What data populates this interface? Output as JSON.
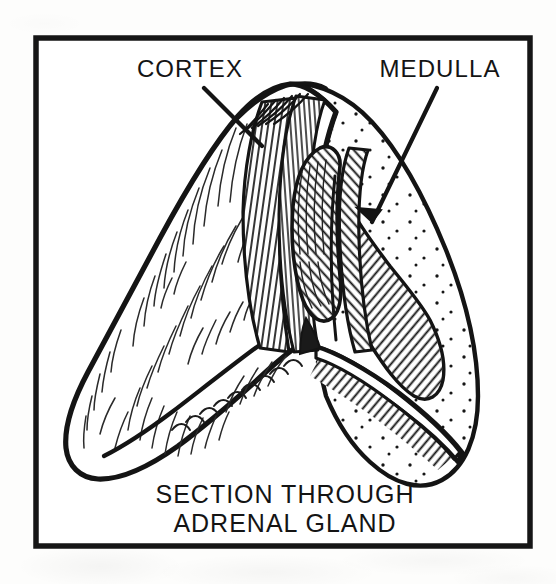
{
  "figure": {
    "kind": "anatomical-line-illustration",
    "frame": {
      "border_color": "#161616",
      "fill_color": "#ffffff",
      "border_width_px": 5
    },
    "ink_color": "#111111",
    "paper_color": "#fdfdfc",
    "annotations": [
      {
        "id": "cortex",
        "label": "CORTEX",
        "label_x": 190,
        "label_y": 77,
        "anchor": "middle",
        "leader": {
          "x1": 204,
          "y1": 88,
          "x2": 262,
          "y2": 146
        },
        "region_texture": "dense-vertical-hatching",
        "description": "outer layer of the gland, shown with close parallel hatch lines"
      },
      {
        "id": "medulla",
        "label": "MEDULLA",
        "label_x": 440,
        "label_y": 77,
        "anchor": "middle",
        "leader": {
          "x1": 437,
          "y1": 88,
          "x2": 370,
          "y2": 223
        },
        "arrowhead": true,
        "region_texture": "stipple-dots",
        "description": "inner core of the gland, shown with stippled dots"
      }
    ],
    "caption": {
      "lines": [
        "SECTION THROUGH",
        "ADRENAL GLAND"
      ],
      "x": 285,
      "line1_y": 503,
      "line2_y": 532,
      "anchor": "middle"
    },
    "textures": [
      {
        "name": "cortex-hatch",
        "type": "parallel-lines",
        "angle_deg": 80,
        "spacing_px": 6
      },
      {
        "name": "medulla-stipple",
        "type": "dots",
        "spacing_px": 26
      },
      {
        "name": "cut-face-hatch",
        "type": "parallel-lines",
        "angle_deg": 55,
        "spacing_px": 6
      },
      {
        "name": "surface-shading",
        "type": "short-curved-strokes"
      }
    ]
  }
}
